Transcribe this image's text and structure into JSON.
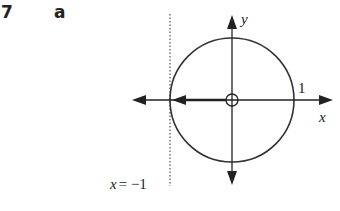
{
  "question": {
    "number": "7",
    "part": "a"
  },
  "diagram": {
    "type": "circle-on-axes",
    "axis_labels": {
      "x": "x",
      "y": "y"
    },
    "tick_label_right": "1",
    "origin_marker": "open-circle",
    "vertical_line_label": "x = −1",
    "vertical_line_style": "dotted",
    "arrow_on_negative_x": "pointing-left",
    "colors": {
      "ink": "#222222",
      "background": "#ffffff"
    }
  }
}
